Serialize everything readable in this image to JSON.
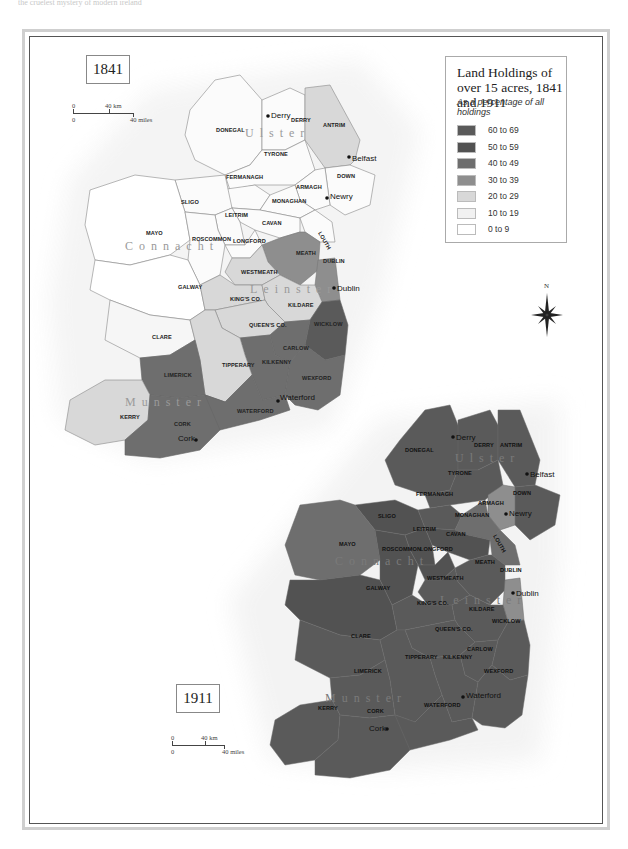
{
  "page": {
    "top_text": "the cruelest mystery of modern ireland"
  },
  "legend": {
    "title": "Land Holdings of over 15 acres, 1841 and 1911",
    "subtitle": "As a percentage of all holdings",
    "items": [
      {
        "label": "60 to 69",
        "color": "#5a5a5a"
      },
      {
        "label": "50 to 59",
        "color": "#525252"
      },
      {
        "label": "40 to 49",
        "color": "#6e6e6e"
      },
      {
        "label": "30 to 39",
        "color": "#8e8e8e"
      },
      {
        "label": "20 to 29",
        "color": "#d8d8d8"
      },
      {
        "label": "10 to 19",
        "color": "#f1f1f1"
      },
      {
        "label": "0 to 9",
        "color": "#ffffff"
      }
    ]
  },
  "compass": {
    "label": "N"
  },
  "map_1841": {
    "year": "1841",
    "scale": {
      "km_zero": "0",
      "km_label": "40 km",
      "mi_zero": "0",
      "mi_label": "40 miles"
    },
    "provinces": [
      "Ulster",
      "Connacht",
      "Leinster",
      "Munster"
    ],
    "towns": [
      "Derry",
      "Belfast",
      "Newry",
      "Dublin",
      "Waterford",
      "Cork"
    ],
    "counties": [
      {
        "name": "DONEGAL",
        "band": "10 to 19"
      },
      {
        "name": "DERRY",
        "band": "10 to 19"
      },
      {
        "name": "ANTRIM",
        "band": "20 to 29"
      },
      {
        "name": "TYRONE",
        "band": "10 to 19"
      },
      {
        "name": "FERMANAGH",
        "band": "10 to 19"
      },
      {
        "name": "ARMAGH",
        "band": "10 to 19"
      },
      {
        "name": "DOWN",
        "band": "10 to 19"
      },
      {
        "name": "MONAGHAN",
        "band": "10 to 19"
      },
      {
        "name": "CAVAN",
        "band": "10 to 19"
      },
      {
        "name": "LOUTH",
        "band": "10 to 19"
      },
      {
        "name": "SLIGO",
        "band": "10 to 19"
      },
      {
        "name": "LEITRIM",
        "band": "10 to 19"
      },
      {
        "name": "MAYO",
        "band": "0 to 9"
      },
      {
        "name": "ROSCOMMON",
        "band": "10 to 19"
      },
      {
        "name": "LONGFORD",
        "band": "10 to 19"
      },
      {
        "name": "GALWAY",
        "band": "0 to 9"
      },
      {
        "name": "MEATH",
        "band": "40 to 49"
      },
      {
        "name": "DUBLIN",
        "band": "30 to 39"
      },
      {
        "name": "WESTMEATH",
        "band": "20 to 29"
      },
      {
        "name": "KING'S CO.",
        "band": "20 to 29"
      },
      {
        "name": "KILDARE",
        "band": "20 to 29"
      },
      {
        "name": "QUEEN'S CO.",
        "band": "20 to 29"
      },
      {
        "name": "WICKLOW",
        "band": "50 to 59"
      },
      {
        "name": "CLARE",
        "band": "10 to 19"
      },
      {
        "name": "TIPPERARY",
        "band": "20 to 29"
      },
      {
        "name": "CARLOW",
        "band": "40 to 49"
      },
      {
        "name": "KILKENNY",
        "band": "40 to 49"
      },
      {
        "name": "WEXFORD",
        "band": "40 to 49"
      },
      {
        "name": "LIMERICK",
        "band": "40 to 49"
      },
      {
        "name": "KERRY",
        "band": "20 to 29"
      },
      {
        "name": "CORK",
        "band": "40 to 49"
      },
      {
        "name": "WATERFORD",
        "band": "40 to 49"
      }
    ]
  },
  "map_1911": {
    "year": "1911",
    "scale": {
      "km_zero": "0",
      "km_label": "40 km",
      "mi_zero": "0",
      "mi_label": "40 miles"
    },
    "provinces": [
      "Ulster",
      "Connacht",
      "Leinster",
      "Munster"
    ],
    "towns": [
      "Derry",
      "Belfast",
      "Newry",
      "Dublin",
      "Waterford",
      "Cork"
    ],
    "counties": [
      {
        "name": "DONEGAL",
        "band": "60 to 69"
      },
      {
        "name": "DERRY",
        "band": "60 to 69"
      },
      {
        "name": "ANTRIM",
        "band": "60 to 69"
      },
      {
        "name": "TYRONE",
        "band": "60 to 69"
      },
      {
        "name": "FERMANAGH",
        "band": "60 to 69"
      },
      {
        "name": "ARMAGH",
        "band": "30 to 39"
      },
      {
        "name": "DOWN",
        "band": "60 to 69"
      },
      {
        "name": "MONAGHAN",
        "band": "40 to 49"
      },
      {
        "name": "CAVAN",
        "band": "50 to 59"
      },
      {
        "name": "LOUTH",
        "band": "40 to 49"
      },
      {
        "name": "SLIGO",
        "band": "50 to 59"
      },
      {
        "name": "LEITRIM",
        "band": "50 to 59"
      },
      {
        "name": "MAYO",
        "band": "40 to 49"
      },
      {
        "name": "ROSCOMMON",
        "band": "50 to 59"
      },
      {
        "name": "LONGFORD",
        "band": "50 to 59"
      },
      {
        "name": "GALWAY",
        "band": "50 to 59"
      },
      {
        "name": "MEATH",
        "band": "60 to 69"
      },
      {
        "name": "DUBLIN",
        "band": "30 to 39"
      },
      {
        "name": "WESTMEATH",
        "band": "60 to 69"
      },
      {
        "name": "KING'S CO.",
        "band": "60 to 69"
      },
      {
        "name": "KILDARE",
        "band": "60 to 69"
      },
      {
        "name": "QUEEN'S CO.",
        "band": "60 to 69"
      },
      {
        "name": "WICKLOW",
        "band": "60 to 69"
      },
      {
        "name": "CLARE",
        "band": "60 to 69"
      },
      {
        "name": "TIPPERARY",
        "band": "60 to 69"
      },
      {
        "name": "CARLOW",
        "band": "60 to 69"
      },
      {
        "name": "KILKENNY",
        "band": "60 to 69"
      },
      {
        "name": "WEXFORD",
        "band": "60 to 69"
      },
      {
        "name": "LIMERICK",
        "band": "60 to 69"
      },
      {
        "name": "KERRY",
        "band": "60 to 69"
      },
      {
        "name": "CORK",
        "band": "60 to 69"
      },
      {
        "name": "WATERFORD",
        "band": "60 to 69"
      }
    ]
  }
}
